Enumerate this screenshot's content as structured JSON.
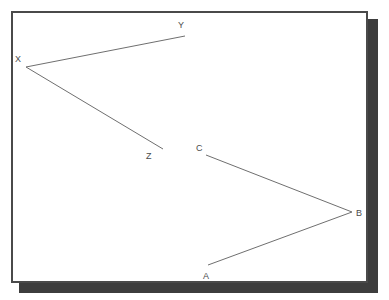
{
  "figure": {
    "background_color": "#ffffff",
    "frame": {
      "border_color": "#4a4a4a",
      "fill_color": "#ffffff",
      "shadow_color": "#3d3d3d",
      "x": 11,
      "y": 11,
      "width": 357,
      "height": 272
    },
    "line_color": "#6f6f6f",
    "label_color": "#4b4b4b",
    "angles": [
      {
        "name": "angle-XYZ",
        "vertex": "X",
        "rays_to": [
          "Y",
          "Z"
        ],
        "points": [
          {
            "label": "Y",
            "x": 185,
            "y": 36,
            "label_x": 178,
            "label_y": 21
          },
          {
            "label": "X",
            "x": 26,
            "y": 67,
            "label_x": 15,
            "label_y": 55
          },
          {
            "label": "Z",
            "x": 163,
            "y": 149,
            "label_x": 146,
            "label_y": 152
          }
        ],
        "path": "M 185 36 L 26 67 L 163 149"
      },
      {
        "name": "angle-CBA",
        "vertex": "B",
        "rays_to": [
          "C",
          "A"
        ],
        "points": [
          {
            "label": "C",
            "x": 206,
            "y": 155,
            "label_x": 196,
            "label_y": 144
          },
          {
            "label": "B",
            "x": 352,
            "y": 212,
            "label_x": 356,
            "label_y": 209
          },
          {
            "label": "A",
            "x": 208,
            "y": 265,
            "label_x": 203,
            "label_y": 272
          }
        ],
        "path": "M 206 155 L 352 212 L 208 265"
      }
    ],
    "labels": [
      {
        "text": "Y",
        "x": 178,
        "y": 21,
        "name": "vertex-label-y"
      },
      {
        "text": "X",
        "x": 15,
        "y": 55,
        "name": "vertex-label-x"
      },
      {
        "text": "Z",
        "x": 146,
        "y": 152,
        "name": "vertex-label-z"
      },
      {
        "text": "C",
        "x": 196,
        "y": 144,
        "name": "vertex-label-c"
      },
      {
        "text": "B",
        "x": 356,
        "y": 209,
        "name": "vertex-label-b"
      },
      {
        "text": "A",
        "x": 203,
        "y": 272,
        "name": "vertex-label-a"
      }
    ]
  }
}
